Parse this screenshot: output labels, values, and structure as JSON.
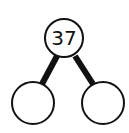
{
  "diagram": {
    "type": "number-bond",
    "whole": "37",
    "parts": [
      "",
      ""
    ],
    "colors": {
      "stroke": "#111111",
      "fill": "#ffffff",
      "background": "#ffffff"
    }
  }
}
